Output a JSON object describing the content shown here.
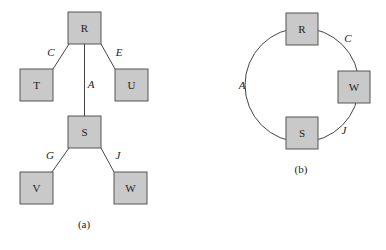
{
  "diagram_a": {
    "caption": "(a)",
    "nodes": [
      {
        "id": "R",
        "label": "R",
        "x": 68,
        "y": 12
      },
      {
        "id": "T",
        "label": "T",
        "x": 20,
        "y": 69
      },
      {
        "id": "U",
        "label": "U",
        "x": 115,
        "y": 69
      },
      {
        "id": "S",
        "label": "S",
        "x": 68,
        "y": 116
      },
      {
        "id": "V",
        "label": "V",
        "x": 20,
        "y": 172
      },
      {
        "id": "W",
        "label": "W",
        "x": 114,
        "y": 172
      }
    ],
    "edges": [
      {
        "from": "R",
        "to": "T",
        "label": "C"
      },
      {
        "from": "R",
        "to": "U",
        "label": "E"
      },
      {
        "from": "R",
        "to": "S",
        "label": "A"
      },
      {
        "from": "S",
        "to": "V",
        "label": "G"
      },
      {
        "from": "S",
        "to": "W",
        "label": "J"
      }
    ]
  },
  "diagram_b": {
    "caption": "(b)",
    "nodes": [
      {
        "id": "R",
        "label": "R"
      },
      {
        "id": "W",
        "label": "W"
      },
      {
        "id": "S",
        "label": "S"
      }
    ],
    "edges": [
      {
        "from": "R",
        "to": "W",
        "label": "C"
      },
      {
        "from": "W",
        "to": "S",
        "label": "J"
      },
      {
        "from": "S",
        "to": "R",
        "label": "A"
      }
    ]
  }
}
